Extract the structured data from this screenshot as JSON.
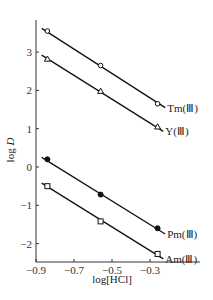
{
  "chart_data": {
    "type": "scatter",
    "title": "",
    "xlabel": "log[HCl]",
    "ylabel": "log D",
    "xlim": [
      -0.9,
      -0.2
    ],
    "ylim": [
      -2.5,
      3.9
    ],
    "xticks": [
      -0.9,
      -0.7,
      -0.5,
      -0.3
    ],
    "xtick_labels": [
      "-0.9",
      "-0.7",
      "-0.5",
      "-0.3"
    ],
    "yticks": [
      -2,
      -1,
      0,
      1,
      2,
      3
    ],
    "ytick_labels": [
      "-2",
      "-1",
      "0",
      "1",
      "2",
      "3"
    ],
    "grid": false,
    "legend": "inline labels at right end of lines",
    "series": [
      {
        "name": "Tm(Ⅲ)",
        "marker": "open-circle",
        "x": [
          -0.84,
          -0.56,
          -0.26
        ],
        "y": [
          3.55,
          2.65,
          1.65
        ],
        "fit_line": {
          "x": [
            -0.87,
            -0.22
          ],
          "y": [
            3.62,
            1.55
          ]
        }
      },
      {
        "name": "Y(Ⅲ)",
        "marker": "open-triangle",
        "x": [
          -0.84,
          -0.56,
          -0.26
        ],
        "y": [
          2.82,
          1.98,
          1.05
        ],
        "fit_line": {
          "x": [
            -0.87,
            -0.23
          ],
          "y": [
            2.92,
            0.93
          ]
        }
      },
      {
        "name": "Pm(Ⅲ)",
        "marker": "filled-circle",
        "x": [
          -0.84,
          -0.56,
          -0.26
        ],
        "y": [
          0.2,
          -0.72,
          -1.6
        ],
        "fit_line": {
          "x": [
            -0.87,
            -0.22
          ],
          "y": [
            0.25,
            -1.75
          ]
        }
      },
      {
        "name": "Am(Ⅲ)",
        "marker": "open-square",
        "x": [
          -0.84,
          -0.56,
          -0.26
        ],
        "y": [
          -0.5,
          -1.42,
          -2.27
        ],
        "fit_line": {
          "x": [
            -0.87,
            -0.23
          ],
          "y": [
            -0.42,
            -2.4
          ]
        }
      }
    ]
  }
}
